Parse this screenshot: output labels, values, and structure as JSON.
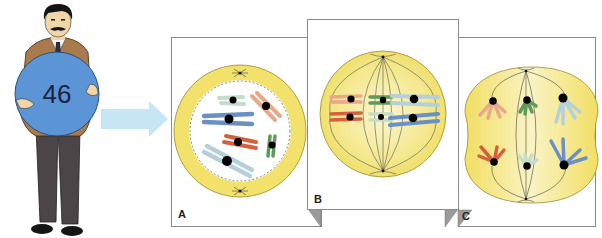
{
  "figure": {
    "person": {
      "ball_label": "46",
      "ball_color": "#5b95d6",
      "jacket_color": "#a87a4c",
      "pants_color": "#4c4548"
    },
    "arrow": {
      "color": "#c6e6f4",
      "direction": "right"
    },
    "panels": [
      {
        "id": "A",
        "label": "A",
        "stage": "prophase"
      },
      {
        "id": "B",
        "label": "B",
        "stage": "metaphase"
      },
      {
        "id": "C",
        "label": "C",
        "stage": "anaphase"
      }
    ],
    "colors": {
      "cytoplasm": "#f2e16a",
      "cytoplasm_light": "#f8f0b8",
      "panel_border": "#8a8a8a",
      "fold_shadow": "#9a9a9a",
      "chromosome_peach": "#e8a88a",
      "chromosome_red": "#d4603e",
      "chromosome_green": "#5f9a5a",
      "chromosome_mint": "#c4dcc8",
      "chromosome_lightblue": "#b4d0dc",
      "chromosome_blue": "#6a90c6"
    }
  }
}
